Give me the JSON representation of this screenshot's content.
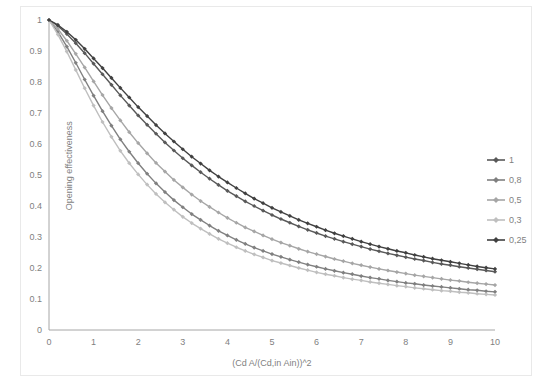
{
  "chart_data": {
    "type": "line",
    "title": "",
    "xlabel": "(Cd A/(Cd,in Ain))^2",
    "ylabel": "Opening effectiveness",
    "xlim": [
      0,
      10
    ],
    "ylim": [
      0,
      1
    ],
    "xticks": [
      "0",
      "1",
      "2",
      "3",
      "4",
      "5",
      "6",
      "7",
      "8",
      "9",
      "10"
    ],
    "yticks": [
      "0",
      "0.1",
      "0.2",
      "0.3",
      "0.4",
      "0.5",
      "0.6",
      "0.7",
      "0.8",
      "0.9",
      "1"
    ],
    "grid": false,
    "legend_position": "right",
    "marker": "diamond",
    "x": [
      0,
      0.2,
      0.4,
      0.6,
      0.8,
      1,
      1.2,
      1.4,
      1.6,
      1.8,
      2,
      2.2,
      2.4,
      2.6,
      2.8,
      3,
      3.2,
      3.4,
      3.6,
      3.8,
      4,
      4.2,
      4.4,
      4.6,
      4.8,
      5,
      5.2,
      5.4,
      5.6,
      5.8,
      6,
      6.2,
      6.4,
      6.6,
      6.8,
      7,
      7.2,
      7.4,
      7.6,
      7.8,
      8,
      8.2,
      8.4,
      8.6,
      8.8,
      9,
      9.2,
      9.4,
      9.6,
      9.8,
      10
    ],
    "series": [
      {
        "name": "1",
        "color": "#595959",
        "values": [
          1,
          0.981,
          0.955,
          0.925,
          0.893,
          0.859,
          0.825,
          0.791,
          0.757,
          0.724,
          0.692,
          0.662,
          0.633,
          0.605,
          0.579,
          0.554,
          0.531,
          0.509,
          0.488,
          0.468,
          0.449,
          0.432,
          0.415,
          0.4,
          0.385,
          0.371,
          0.358,
          0.346,
          0.334,
          0.323,
          0.313,
          0.303,
          0.294,
          0.285,
          0.277,
          0.269,
          0.261,
          0.254,
          0.247,
          0.241,
          0.235,
          0.229,
          0.224,
          0.218,
          0.213,
          0.209,
          0.204,
          0.2,
          0.196,
          0.192,
          0.188
        ]
      },
      {
        "name": "0,8",
        "color": "#808080",
        "values": [
          1,
          0.962,
          0.914,
          0.862,
          0.808,
          0.756,
          0.706,
          0.659,
          0.615,
          0.575,
          0.538,
          0.504,
          0.473,
          0.445,
          0.419,
          0.396,
          0.374,
          0.355,
          0.337,
          0.32,
          0.305,
          0.291,
          0.278,
          0.266,
          0.255,
          0.245,
          0.236,
          0.227,
          0.219,
          0.211,
          0.204,
          0.197,
          0.191,
          0.185,
          0.18,
          0.174,
          0.169,
          0.165,
          0.16,
          0.156,
          0.152,
          0.149,
          0.145,
          0.142,
          0.139,
          0.136,
          0.133,
          0.13,
          0.128,
          0.125,
          0.123
        ]
      },
      {
        "name": "0,5",
        "color": "#a6a6a6",
        "values": [
          1,
          0.971,
          0.933,
          0.891,
          0.847,
          0.802,
          0.758,
          0.716,
          0.676,
          0.638,
          0.603,
          0.57,
          0.539,
          0.511,
          0.484,
          0.46,
          0.437,
          0.416,
          0.397,
          0.379,
          0.362,
          0.346,
          0.331,
          0.318,
          0.305,
          0.293,
          0.282,
          0.272,
          0.262,
          0.253,
          0.245,
          0.237,
          0.229,
          0.222,
          0.215,
          0.209,
          0.203,
          0.197,
          0.192,
          0.187,
          0.182,
          0.177,
          0.173,
          0.169,
          0.165,
          0.161,
          0.158,
          0.154,
          0.151,
          0.148,
          0.145
        ]
      },
      {
        "name": "0,3",
        "color": "#bfbfbf",
        "values": [
          1,
          0.953,
          0.898,
          0.839,
          0.78,
          0.724,
          0.671,
          0.623,
          0.578,
          0.538,
          0.502,
          0.469,
          0.439,
          0.412,
          0.388,
          0.365,
          0.345,
          0.327,
          0.31,
          0.294,
          0.28,
          0.267,
          0.255,
          0.244,
          0.234,
          0.224,
          0.216,
          0.208,
          0.2,
          0.193,
          0.186,
          0.18,
          0.175,
          0.169,
          0.164,
          0.16,
          0.155,
          0.151,
          0.147,
          0.143,
          0.14,
          0.136,
          0.133,
          0.13,
          0.127,
          0.125,
          0.122,
          0.12,
          0.117,
          0.115,
          0.113
        ]
      },
      {
        "name": "0,25",
        "color": "#404040",
        "values": [
          1,
          0.984,
          0.962,
          0.936,
          0.907,
          0.876,
          0.845,
          0.813,
          0.781,
          0.75,
          0.719,
          0.69,
          0.661,
          0.634,
          0.608,
          0.583,
          0.559,
          0.537,
          0.515,
          0.495,
          0.476,
          0.458,
          0.441,
          0.424,
          0.409,
          0.394,
          0.381,
          0.368,
          0.355,
          0.344,
          0.333,
          0.322,
          0.312,
          0.303,
          0.294,
          0.285,
          0.277,
          0.269,
          0.262,
          0.255,
          0.249,
          0.242,
          0.236,
          0.23,
          0.225,
          0.22,
          0.215,
          0.21,
          0.205,
          0.201,
          0.197
        ]
      }
    ]
  }
}
